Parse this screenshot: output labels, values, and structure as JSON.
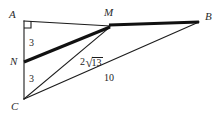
{
  "figure": {
    "type": "geometry-diagram",
    "background_color": "#ffffff",
    "stroke_color": "#1c1c1c",
    "label_color": "#2b2b2b",
    "vertices": [
      {
        "id": "A",
        "label": "A",
        "x": 24,
        "y": 21
      },
      {
        "id": "M",
        "label": "M",
        "x": 110,
        "y": 27
      },
      {
        "id": "B",
        "label": "B",
        "x": 199,
        "y": 22
      },
      {
        "id": "N",
        "label": "N",
        "x": 24,
        "y": 61
      },
      {
        "id": "C",
        "label": "C",
        "x": 24,
        "y": 99
      }
    ],
    "vertex_labels": [
      {
        "name": "vertex-label-A",
        "text": "A",
        "x": 9,
        "y": 9
      },
      {
        "name": "vertex-label-M",
        "text": "M",
        "x": 104,
        "y": 7
      },
      {
        "name": "vertex-label-B",
        "text": "B",
        "x": 205,
        "y": 11
      },
      {
        "name": "vertex-label-N",
        "text": "N",
        "x": 10,
        "y": 56
      },
      {
        "name": "vertex-label-C",
        "text": "C",
        "x": 11,
        "y": 101
      }
    ],
    "segments": [
      {
        "name": "segment-A-M",
        "from": "A",
        "to": "M",
        "width": 1.1,
        "style": "thin"
      },
      {
        "name": "segment-M-B",
        "from": "M",
        "to": "B",
        "width": 3.0,
        "style": "thick"
      },
      {
        "name": "segment-A-C",
        "from": "A",
        "to": "C",
        "width": 1.1,
        "style": "thin"
      },
      {
        "name": "segment-N-M",
        "from": "N",
        "to": "M",
        "width": 3.0,
        "style": "thick"
      },
      {
        "name": "segment-C-M",
        "from": "C",
        "to": "M",
        "width": 1.1,
        "style": "thin"
      },
      {
        "name": "segment-C-B",
        "from": "C",
        "to": "B",
        "width": 1.1,
        "style": "thin"
      }
    ],
    "right_angle_marker": {
      "name": "right-angle-marker-A",
      "at_vertex": "A",
      "x": 24,
      "y": 21,
      "size": 6
    },
    "measure_labels": [
      {
        "name": "length-label-AN",
        "text": "3",
        "x": 29,
        "y": 38,
        "segment": "A-N"
      },
      {
        "name": "length-label-NC",
        "text": "3",
        "x": 29,
        "y": 74,
        "segment": "N-C"
      },
      {
        "name": "length-label-CB",
        "text": "10",
        "x": 104,
        "y": 73,
        "segment": "C-B"
      }
    ],
    "radical_label": {
      "name": "length-label-CM",
      "coefficient": "2",
      "surd": "√",
      "radicand": "13",
      "full_text": "2√13",
      "x": 80,
      "y": 56,
      "segment": "C-M"
    }
  }
}
